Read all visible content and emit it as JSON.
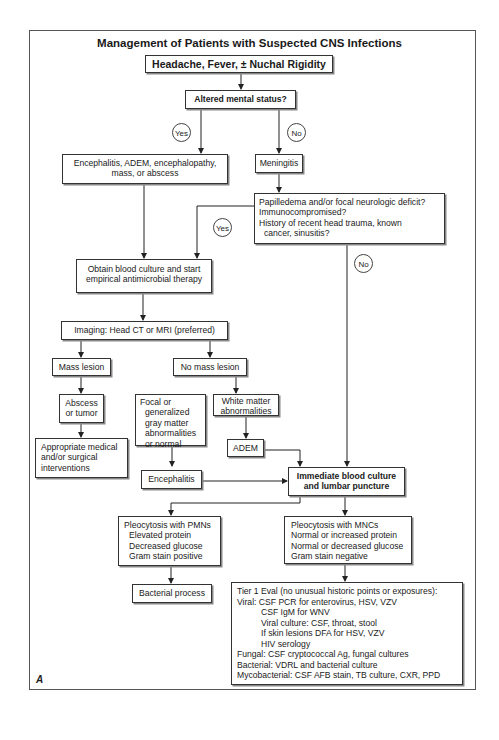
{
  "title": "Management of Patients with Suspected CNS Infections",
  "panel_label": "A",
  "nodes": {
    "presentation": "Headache, Fever, ± Nuchal Rigidity",
    "altered": "Altered mental status?",
    "enceph_group": [
      "Encephalitis, ADEM, encephalopathy,",
      "mass, or abscess"
    ],
    "meningitis": "Meningitis",
    "risk_questions": [
      "Papilledema and/or focal neurologic deficit?",
      "Immunocompromised?",
      "History of recent head trauma, known",
      "cancer, sinusitis?"
    ],
    "obtain_culture": [
      "Obtain blood culture and start",
      "empirical antimicrobial therapy"
    ],
    "imaging": "Imaging: Head CT or MRI (preferred)",
    "mass_lesion": "Mass lesion",
    "no_mass_lesion": "No mass lesion",
    "abscess": [
      "Abscess",
      "or tumor"
    ],
    "interventions": [
      "Appropriate medical",
      "and/or surgical",
      "interventions"
    ],
    "gray_matter": [
      "Focal or",
      "generalized",
      "gray matter",
      "abnormalities",
      "or normal"
    ],
    "white_matter": [
      "White matter",
      "abnormalities"
    ],
    "adem": "ADEM",
    "encephalitis": "Encephalitis",
    "lumbar": [
      "Immediate blood culture",
      "and lumbar puncture"
    ],
    "pmn": [
      "Pleocytosis with PMNs",
      "Elevated protein",
      "Decreased glucose",
      "Gram stain positive"
    ],
    "mnc": [
      "Pleocytosis with MNCs",
      "Normal or increased protein",
      "Normal or decreased glucose",
      "Gram stain negative"
    ],
    "bacterial": "Bacterial process",
    "tier1": {
      "heading": "Tier 1 Eval (no unusual historic points or exposures):",
      "viral": [
        "Viral: CSF PCR for enterovirus, HSV, VZV",
        "CSF IgM for WNV",
        "Viral culture: CSF, throat, stool",
        "If skin lesions DFA for HSV, VZV",
        "HIV serology"
      ],
      "fungal": "Fungal: CSF cryptococcal Ag, fungal cultures",
      "bacterial": "Bacterial: VDRL and bacterial culture",
      "mycobacterial": "Mycobacterial: CSF AFB stain, TB culture, CXR, PPD"
    }
  },
  "labels": {
    "yes": "Yes",
    "no": "No"
  }
}
